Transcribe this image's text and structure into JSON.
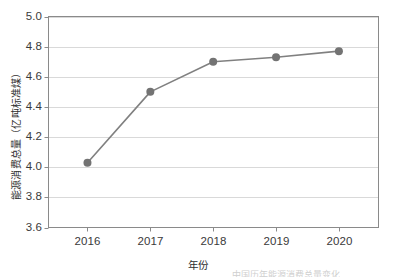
{
  "chart_data": {
    "type": "line",
    "title": "",
    "subtitle": "",
    "xlabel": "年份",
    "ylabel": "能源消费总量（亿吨标准煤）",
    "categories": [
      "2016",
      "2017",
      "2018",
      "2019",
      "2020"
    ],
    "x": [
      2016,
      2017,
      2018,
      2019,
      2020
    ],
    "values": [
      4.03,
      4.5,
      4.7,
      4.73,
      4.77
    ],
    "series": [
      {
        "name": "能源消费总量",
        "values": [
          4.03,
          4.5,
          4.7,
          4.73,
          4.77
        ]
      }
    ],
    "ylim": [
      3.6,
      5.0
    ],
    "yticks": [
      "3.6",
      "3.8",
      "4.0",
      "4.2",
      "4.4",
      "4.6",
      "4.8",
      "5.0"
    ],
    "ytick_values": [
      3.6,
      3.8,
      4.0,
      4.2,
      4.4,
      4.6,
      4.8,
      5.0
    ],
    "xticks": [
      "2016",
      "2017",
      "2018",
      "2019",
      "2020"
    ],
    "grid": "horizontal",
    "legend": "none",
    "marker": "circle",
    "line_color": "#808080",
    "marker_color": "#737373",
    "grid_color": "#d9d9d9",
    "axis_color": "#7f7f7f",
    "background": "#ffffff"
  },
  "footnote": {
    "text": "中国历年能源消费总量变化"
  }
}
